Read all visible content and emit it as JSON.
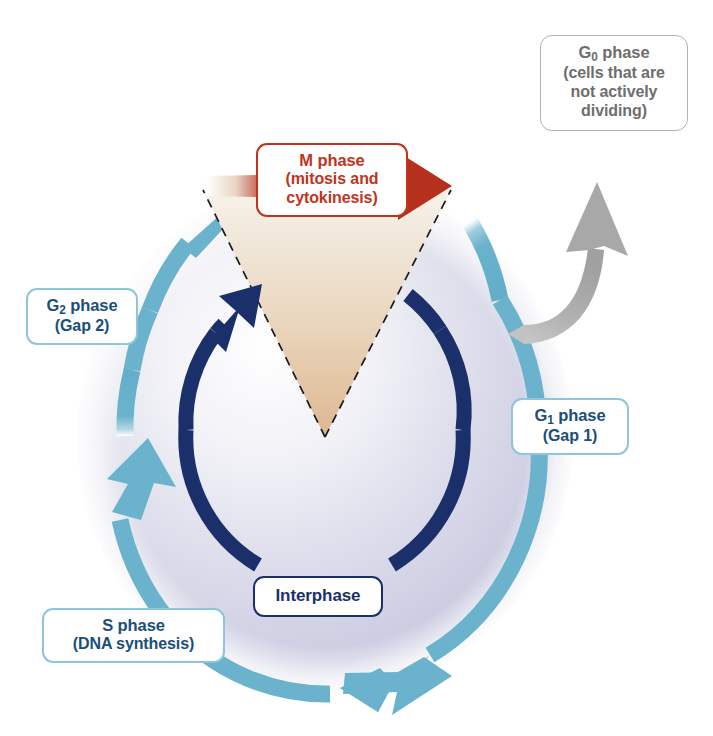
{
  "figure": {
    "type": "cell-cycle-diagram",
    "background_color": "#ffffff"
  },
  "top_caption": {
    "text": ""
  },
  "labels": {
    "m_phase": {
      "title_prefix": "M",
      "title_suffix": " phase",
      "title": "M phase",
      "subtitle_line1": "(mitosis and",
      "subtitle_line2": "cytokinesis)",
      "color": "#c0341d",
      "border_color": "#c0341d"
    },
    "g0_phase": {
      "title_prefix": "G",
      "title_subscript": "0",
      "title_suffix": " phase",
      "subtitle_line1": "(cells that are",
      "subtitle_line2": "not actively",
      "subtitle_line3": "dividing)",
      "color": "#6e6e6e",
      "border_color": "#b2b2b2"
    },
    "g1_phase": {
      "title_prefix": "G",
      "title_subscript": "1",
      "title_suffix": " phase",
      "subtitle": "(Gap 1)",
      "color": "#1a4f78",
      "border_color": "#8fc5da"
    },
    "g2_phase": {
      "title_prefix": "G",
      "title_subscript": "2",
      "title_suffix": " phase",
      "subtitle": "(Gap 2)",
      "color": "#1a4f78",
      "border_color": "#8fc5da"
    },
    "s_phase": {
      "title": "S phase",
      "subtitle": "(DNA synthesis)",
      "color": "#1a4f78",
      "border_color": "#8fc5da"
    },
    "interphase": {
      "title": "Interphase",
      "color": "#1b2f6b",
      "border_color": "#1b2f6b"
    }
  },
  "graphics": {
    "sphere": {
      "name": "cell-sphere",
      "center_x": 325,
      "center_y": 435,
      "radius_x": 245,
      "radius_y": 255,
      "fill_light": "#ffffff",
      "fill_mid": "#d7d8e8",
      "fill_edge": "#c3c5dd"
    },
    "outer_ring": {
      "name": "outer-cycle-ring",
      "color": "#6bb3cd",
      "stroke_width": 17,
      "direction": "clockwise",
      "arrow_count": 3
    },
    "inner_arc": {
      "name": "interphase-arc",
      "color": "#1b2f6b",
      "stroke_width": 15,
      "direction": "clockwise",
      "arrow_count": 1
    },
    "m_wedge": {
      "name": "m-phase-wedge",
      "fill_top": "#f2ece4",
      "fill_bottom": "#e2bb97",
      "border_style": "dashed",
      "border_color": "#1a1a1a",
      "apex_x": 325,
      "apex_y": 437
    },
    "m_arrow": {
      "name": "m-phase-arrow",
      "color": "#b5311d"
    },
    "g0_arrow": {
      "name": "g0-exit-arrow",
      "color": "#a8a8a8"
    }
  }
}
